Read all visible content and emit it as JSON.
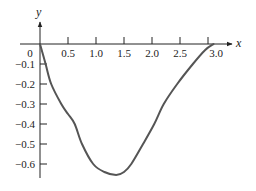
{
  "chart_data": {
    "type": "line",
    "title": "",
    "xlabel": "x",
    "ylabel": "y",
    "xlim": [
      0,
      3.2
    ],
    "ylim": [
      -0.68,
      0.12
    ],
    "grid": false,
    "legend": null,
    "x_ticks": [
      "0",
      "0.5",
      "1.0",
      "1.5",
      "2.0",
      "2.5",
      "3.0"
    ],
    "x_tick_values": [
      0,
      0.5,
      1.0,
      1.5,
      2.0,
      2.5,
      3.0
    ],
    "y_ticks": [
      "-0.1",
      "-0.2",
      "-0.3",
      "-0.4",
      "-0.5",
      "-0.6"
    ],
    "y_tick_values": [
      -0.1,
      -0.2,
      -0.3,
      -0.4,
      -0.5,
      -0.6
    ],
    "series": [
      {
        "name": "curve",
        "color": "#555555",
        "x": [
          0.0,
          0.1,
          0.2,
          0.38,
          0.5,
          0.62,
          0.75,
          0.95,
          1.15,
          1.36,
          1.5,
          1.63,
          1.84,
          2.04,
          2.21,
          2.45,
          2.73,
          2.95,
          3.1
        ],
        "y": [
          0.0,
          -0.1,
          -0.2,
          -0.3,
          -0.35,
          -0.4,
          -0.5,
          -0.6,
          -0.64,
          -0.655,
          -0.64,
          -0.6,
          -0.5,
          -0.4,
          -0.3,
          -0.2,
          -0.1,
          -0.03,
          0.0
        ]
      }
    ]
  },
  "labels": {
    "x_axis": "x",
    "y_axis": "y",
    "origin": "0"
  }
}
